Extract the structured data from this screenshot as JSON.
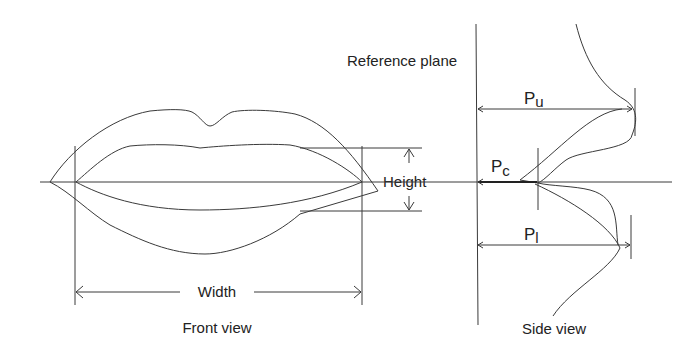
{
  "diagram": {
    "front_view": {
      "caption": "Front view",
      "width_label": "Width",
      "height_label": "Height"
    },
    "side_view": {
      "caption": "Side view",
      "reference_plane_label": "Reference plane",
      "pu_main": "P",
      "pu_sub": "u",
      "pc_main": "P",
      "pc_sub": "c",
      "pl_main": "P",
      "pl_sub": "l"
    }
  }
}
